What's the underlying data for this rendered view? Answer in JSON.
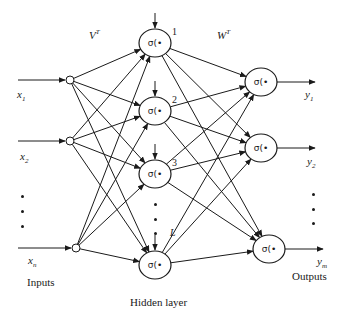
{
  "diagram": {
    "type": "feedforward-neural-network",
    "labels": {
      "input_weights": "V",
      "input_weights_sup": "T",
      "output_weights": "W",
      "output_weights_sup": "T",
      "inputs": "Inputs",
      "hidden_layer": "Hidden layer",
      "outputs": "Outputs"
    },
    "activation_label": "σ(•",
    "input_nodes": [
      {
        "id": "x1",
        "label": "x",
        "sub": "1",
        "x": 70,
        "y": 80
      },
      {
        "id": "x2",
        "label": "x",
        "sub": "2",
        "x": 70,
        "y": 141
      },
      {
        "id": "xn",
        "label": "x",
        "sub": "n",
        "x": 76,
        "y": 248
      }
    ],
    "hidden_nodes": [
      {
        "id": "h1",
        "index": "1",
        "x": 155,
        "y": 43
      },
      {
        "id": "h2",
        "index": "2",
        "x": 155,
        "y": 111
      },
      {
        "id": "h3",
        "index": "3",
        "x": 155,
        "y": 174
      },
      {
        "id": "hL",
        "index": "L",
        "x": 155,
        "y": 265
      }
    ],
    "output_nodes": [
      {
        "id": "y1",
        "label": "y",
        "sub": "1",
        "x": 261,
        "y": 82
      },
      {
        "id": "y2",
        "label": "y",
        "sub": "2",
        "x": 261,
        "y": 148
      },
      {
        "id": "ym",
        "label": "y",
        "sub": "m",
        "x": 269,
        "y": 249
      }
    ],
    "ellipsis": {
      "inputs": "⋮",
      "hidden": "⋮",
      "outputs": "⋮"
    }
  }
}
